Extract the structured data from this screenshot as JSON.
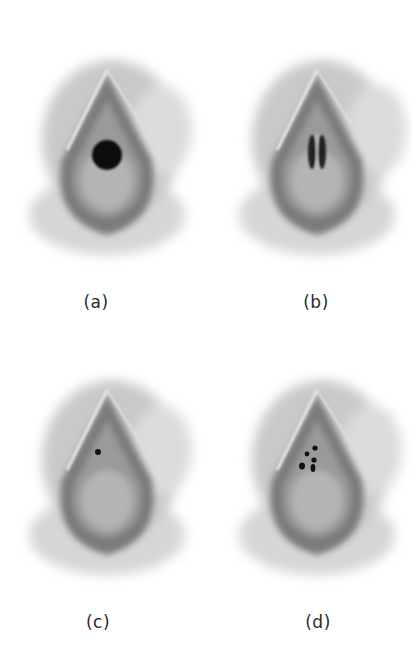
{
  "figure": {
    "panels": [
      {
        "id": "a",
        "label": "(a)",
        "variant": "single-large-round-opening"
      },
      {
        "id": "b",
        "label": "(b)",
        "variant": "vertical-septum-two-slits"
      },
      {
        "id": "c",
        "label": "(c)",
        "variant": "single-tiny-opening"
      },
      {
        "id": "d",
        "label": "(d)",
        "variant": "multiple-small-openings"
      }
    ],
    "colors": {
      "background": "#ffffff",
      "shade_light": "#c8c8c8",
      "shade_mid": "#8a8a8a",
      "shade_dark": "#555555",
      "opening": "#111111",
      "label": "#2a2a2a"
    }
  }
}
